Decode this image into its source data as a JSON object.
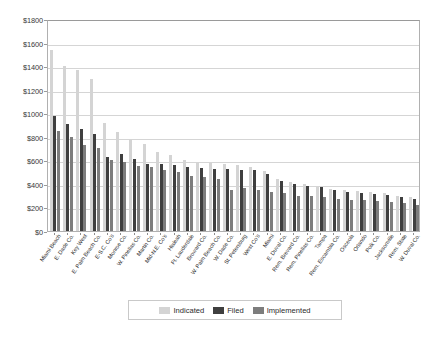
{
  "chart_data": {
    "type": "bar",
    "title": "",
    "xlabel": "",
    "ylabel": "",
    "ylim": [
      0,
      1800
    ],
    "ytick_values": [
      0,
      200,
      400,
      600,
      800,
      1000,
      1200,
      1400,
      1600,
      1800
    ],
    "ytick_labels": [
      "$0",
      "$200",
      "$400",
      "$600",
      "$800",
      "$1000",
      "$1200",
      "$1400",
      "$1600",
      "$1800"
    ],
    "grid": true,
    "legend_position": "bottom",
    "categories": [
      "Miami Beach",
      "E. Dade Co.",
      "Key West",
      "E. Palm Beach Co.",
      "E-S.C. Co's",
      "Monroe Co.",
      "W. Pinellas Co.",
      "Martin Co.",
      "Mid-N.E. Co's",
      "Hialeah",
      "Ft. Lauderdale",
      "Broward Co.",
      "W. Palm Beach Co.",
      "W. Dade Co.",
      "St. Petersburg",
      "West Co's",
      "Miami",
      "E. Duval Co.",
      "Rem. Brevard Co.",
      "Rem. Pinellas Co.",
      "Tampa",
      "Rem. Escambia Co.",
      "Osceola",
      "Orlando",
      "Polk Co.",
      "Jacksonville",
      "Rem. State",
      "W. Duval Co."
    ],
    "series": [
      {
        "name": "Indicated",
        "color": "#d4d4d4",
        "values": [
          1535,
          1400,
          1370,
          1290,
          915,
          840,
          780,
          740,
          675,
          645,
          600,
          590,
          575,
          570,
          560,
          545,
          510,
          440,
          415,
          400,
          385,
          360,
          350,
          340,
          330,
          320,
          300,
          290
        ]
      },
      {
        "name": "Filed",
        "color": "#3f3f3f",
        "values": [
          980,
          905,
          865,
          820,
          630,
          655,
          610,
          570,
          565,
          560,
          545,
          535,
          530,
          525,
          520,
          515,
          480,
          425,
          400,
          385,
          370,
          345,
          335,
          325,
          315,
          305,
          285,
          275
        ]
      },
      {
        "name": "Implemented",
        "color": "#7d7d7d",
        "values": [
          845,
          795,
          730,
          705,
          600,
          585,
          555,
          545,
          520,
          500,
          470,
          455,
          440,
          345,
          365,
          350,
          330,
          320,
          300,
          295,
          285,
          270,
          265,
          260,
          255,
          250,
          235,
          220
        ]
      }
    ]
  },
  "legend": {
    "items": [
      {
        "label": "Indicated"
      },
      {
        "label": "Filed"
      },
      {
        "label": "Implemented"
      }
    ]
  }
}
